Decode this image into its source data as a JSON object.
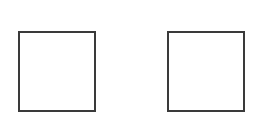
{
  "diagram": {
    "background": "#ffffff",
    "stroke_color": "#3a3a3a",
    "stroke_width": 2,
    "shapes": [
      {
        "type": "square",
        "fill": "#ffffff",
        "x": 18,
        "y": 31,
        "width": 78,
        "height": 81
      },
      {
        "type": "square",
        "fill": "#ffffff",
        "x": 167,
        "y": 31,
        "width": 78,
        "height": 81
      }
    ]
  }
}
